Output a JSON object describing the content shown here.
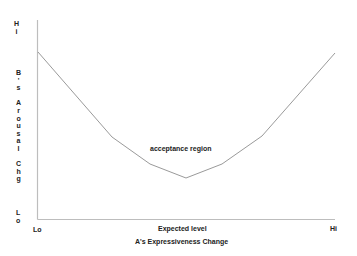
{
  "chart_data": {
    "type": "line",
    "title": "",
    "xlabel": "A's Expressiveness Change",
    "ylabel": "B's Arousal Chg",
    "x_ticks": [
      "Lo",
      "Expected level",
      "Hi"
    ],
    "y_ticks": [
      "Hi",
      "Lo"
    ],
    "grid": false,
    "legend": null,
    "annotations": [
      "acceptance region"
    ],
    "series": [
      {
        "name": "arousal curve",
        "x": [
          0,
          0.25,
          0.38,
          0.5,
          0.62,
          0.75,
          1.0
        ],
        "y": [
          0.83,
          0.49,
          0.34,
          0.25,
          0.34,
          0.5,
          0.83
        ]
      }
    ],
    "xlim": [
      0,
      1
    ],
    "ylim": [
      0,
      1
    ]
  },
  "labels": {
    "y_hi": "Hi",
    "y_lo": "Lo",
    "y_axis_title": [
      "B",
      "'",
      "s",
      "",
      "A",
      "r",
      "o",
      "u",
      "s",
      "a",
      "l",
      "",
      "C",
      "h",
      "g"
    ],
    "x_lo": "Lo",
    "x_mid": "Expected level",
    "x_hi": "Hi",
    "x_axis_title": "A's Expressiveness Change",
    "region": "acceptance region"
  },
  "colors": {
    "axis": "#bdbdbd",
    "curve": "#9a9a9a",
    "text": "#222222"
  }
}
